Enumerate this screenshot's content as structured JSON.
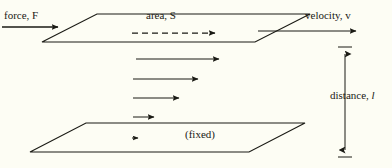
{
  "figure": {
    "kind": "physics-shear-flow-diagram",
    "background_color": "#fdfdf4",
    "ink_color": "#1a1a14"
  },
  "labels": {
    "force": "force, F",
    "area": "area, S",
    "velocity": "velocity, v",
    "distance_text": "distance, ",
    "distance_symbol": "l",
    "fixed": "(fixed)"
  },
  "geometry": {
    "top_plate": {
      "name": "moving-plate",
      "points": "42,42 97,14 310,14 255,42"
    },
    "bottom_plate": {
      "name": "fixed-plate",
      "points": "30,152 86,123 305,123 249,152"
    }
  },
  "arrows": {
    "force": {
      "x1": 2,
      "y1": 27,
      "x2": 62,
      "y2": 27,
      "style": "solid"
    },
    "velocity": {
      "x1": 258,
      "y1": 31,
      "x2": 360,
      "y2": 31,
      "style": "solid"
    },
    "area_dashed": {
      "x1": 132,
      "y1": 33,
      "x2": 219,
      "y2": 33,
      "style": "dashed"
    },
    "gradient": [
      {
        "x1": 136,
        "y1": 59,
        "x2": 223,
        "y2": 59,
        "style": "solid"
      },
      {
        "x1": 133,
        "y1": 79,
        "x2": 202,
        "y2": 79,
        "style": "solid"
      },
      {
        "x1": 133,
        "y1": 98,
        "x2": 183,
        "y2": 98,
        "style": "solid"
      },
      {
        "x1": 133,
        "y1": 117,
        "x2": 158,
        "y2": 117,
        "style": "solid"
      },
      {
        "x1": 132,
        "y1": 138,
        "x2": 141,
        "y2": 138,
        "style": "solid"
      }
    ],
    "distance_dimension": {
      "x": 345,
      "y_top": 47,
      "y_bottom": 157,
      "style": "double-headed-with-caps",
      "cap_half_width": 7
    }
  }
}
